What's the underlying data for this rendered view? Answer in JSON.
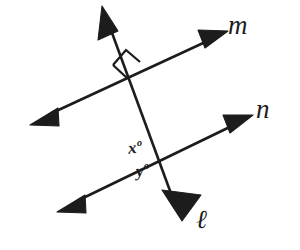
{
  "figure": {
    "kind": "geometry-diagram",
    "background_color": "#ffffff",
    "stroke_color": "#1c1c1c",
    "width": 300,
    "height": 250
  },
  "lines": [
    {
      "id": "line-m",
      "label": "m",
      "label_position": "upper-right",
      "start": {
        "x": 42,
        "y": 118
      },
      "end": {
        "x": 225,
        "y": 33
      },
      "arrowheads": "both"
    },
    {
      "id": "line-n",
      "label": "n",
      "label_position": "right",
      "start": {
        "x": 68,
        "y": 205
      },
      "end": {
        "x": 250,
        "y": 117
      },
      "arrowheads": "both"
    },
    {
      "id": "line-l",
      "label": "ℓ",
      "label_position": "bottom-right",
      "start": {
        "x": 103,
        "y": 8
      },
      "end": {
        "x": 180,
        "y": 218
      },
      "arrowheads": "both"
    }
  ],
  "intersections": [
    {
      "id": "intersection-l-m",
      "lines": [
        "line-l",
        "line-m"
      ],
      "x": 134,
      "y": 79,
      "marker": "right-angle-square",
      "marker_quadrant": "upper-left"
    },
    {
      "id": "intersection-l-n",
      "lines": [
        "line-l",
        "line-n"
      ],
      "x": 168,
      "y": 158,
      "marker": "none"
    }
  ],
  "angle_labels": [
    {
      "id": "angle-x",
      "variable": "x",
      "degree_symbol": "º",
      "text": "xº",
      "position": "above-left-of-intersection-l-n"
    },
    {
      "id": "angle-y",
      "variable": "y",
      "degree_symbol": "º",
      "text": "yº",
      "position": "below-left-of-intersection-l-n"
    }
  ]
}
